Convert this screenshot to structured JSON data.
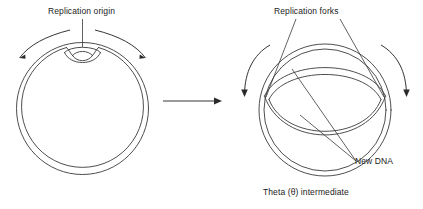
{
  "figure": {
    "stroke_color": "#3a3a3a",
    "text_color": "#1b1b1b",
    "background": "#ffffff",
    "labels": {
      "replication_origin": "Replication origin",
      "replication_forks": "Replication forks",
      "new_dna": "New DNA",
      "caption": "Theta (θ) intermediate"
    },
    "stages": [
      {
        "id": "stage-initiation",
        "name": "Circular chromosome with replication origin",
        "shape": "double-circle",
        "bubble": "small replication bubble at top",
        "arrows": [
          "curved arrow left (counterclockwise fork movement)",
          "curved arrow right (clockwise fork movement)"
        ]
      },
      {
        "id": "stage-theta",
        "name": "Theta intermediate",
        "shape": "double-circle with large replication bubble (lens)",
        "bubble": "enlarged replication bubble spanning upper half",
        "arrows": [
          "curved arrow left (fork movement)",
          "curved arrow right (fork movement)"
        ]
      }
    ],
    "transition_arrow": "right-pointing arrow between stages"
  }
}
